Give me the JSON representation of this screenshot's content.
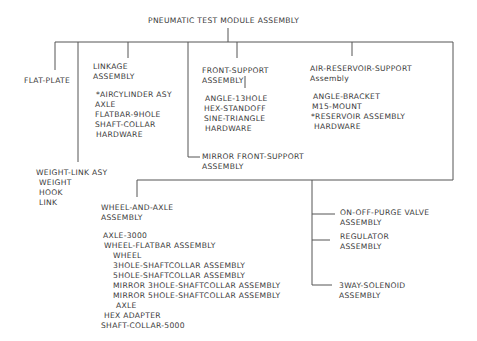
{
  "title": "PNEUMATIC TEST MODULE ASSEMBLY",
  "nodes": {
    "flat_plate": {
      "label": "FLAT-PLATE"
    },
    "linkage": {
      "label_line1": "LINKAGE",
      "label_line2": "ASSEMBLY",
      "items": [
        "*AIRCYLINDER ASY",
        "AXLE",
        "FLATBAR-9HOLE",
        "SHAFT-COLLAR",
        "HARDWARE"
      ]
    },
    "front_support": {
      "label_line1": "FRONT-SUPPORT",
      "label_line2": "ASSEMBLY",
      "items": [
        "ANGLE-13HOLE",
        "HEX-STANDOFF",
        "SINE-TRIANGLE",
        "HARDWARE"
      ]
    },
    "air_reservoir_support": {
      "label_line1": "AIR-RESERVOIR-SUPPORT",
      "label_line2": "Assembly",
      "items": [
        "ANGLE-BRACKET",
        "M15-MOUNT",
        "*RESERVOIR ASSEMBLY",
        "HARDWARE"
      ]
    },
    "mirror_front_support": {
      "label_line1": "MIRROR FRONT-SUPPORT",
      "label_line2": "ASSEMBLY"
    },
    "weight_link": {
      "label": "WEIGHT-LINK ASY",
      "items": [
        "WEIGHT",
        "HOOK",
        "LINK"
      ]
    },
    "wheel_and_axle": {
      "label_line1": "WHEEL-AND-AXLE",
      "label_line2": "ASSEMBLY",
      "items": [
        {
          "text": "AXLE-3000",
          "indent": 1
        },
        {
          "text": "WHEEL-FLATBAR ASSEMBLY",
          "indent": 1
        },
        {
          "text": "WHEEL",
          "indent": 2
        },
        {
          "text": "3HOLE-SHAFTCOLLAR ASSEMBLY",
          "indent": 2
        },
        {
          "text": "5HOLE-SHAFTCOLLAR ASSEMBLY",
          "indent": 2
        },
        {
          "text": "MIRROR 3HOLE-SHAFTCOLLAR ASSEMBLY",
          "indent": 2
        },
        {
          "text": "MIRROR 5HOLE-SHAFTCOLLAR ASSEMBLY",
          "indent": 2
        },
        {
          "text": "AXLE",
          "indent": 2
        },
        {
          "text": "HEX ADAPTER",
          "indent": 1
        },
        {
          "text": "SHAFT-COLLAR-5000",
          "indent": 0
        }
      ]
    },
    "on_off_purge_valve": {
      "label_line1": "ON-OFF-PURGE VALVE",
      "label_line2": "ASSEMBLY"
    },
    "regulator": {
      "label_line1": "REGULATOR",
      "label_line2": "ASSEMBLY"
    },
    "three_way_solenoid": {
      "label_line1": "3WAY-SOLENOID",
      "label_line2": "ASSEMBLY"
    }
  },
  "colors": {
    "line": "#555555",
    "text": "#3a3a3a",
    "background": "#ffffff"
  }
}
